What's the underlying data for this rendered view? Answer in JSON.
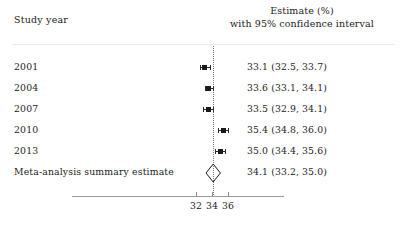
{
  "header": {
    "study_column_label": "Study year",
    "estimate_column_line1": "Estimate (%)",
    "estimate_column_line2": "with 95% confidence interval"
  },
  "chart_data": {
    "type": "forest",
    "title": "",
    "xlabel": "",
    "ylabel": "",
    "xlim": [
      30.5,
      37.5
    ],
    "xticks": [
      32,
      34,
      36
    ],
    "xtick_labels": [
      "32",
      "34",
      "36"
    ],
    "grid": false,
    "reference_line": 34.1,
    "reference_line_style": "dotted",
    "categories": [
      "2001",
      "2004",
      "2007",
      "2010",
      "2013",
      "Meta-analysis summary estimate"
    ],
    "rows": [
      {
        "label": "2001",
        "estimate": 33.1,
        "ci_low": 32.5,
        "ci_high": 33.7,
        "value_text": "33.1 (32.5, 33.7)",
        "marker": "square"
      },
      {
        "label": "2004",
        "estimate": 33.6,
        "ci_low": 33.1,
        "ci_high": 34.1,
        "value_text": "33.6 (33.1, 34.1)",
        "marker": "square"
      },
      {
        "label": "2007",
        "estimate": 33.5,
        "ci_low": 32.9,
        "ci_high": 34.1,
        "value_text": "33.5 (32.9, 34.1)",
        "marker": "square"
      },
      {
        "label": "2010",
        "estimate": 35.4,
        "ci_low": 34.8,
        "ci_high": 36.0,
        "value_text": "35.4 (34.8, 36.0)",
        "marker": "square"
      },
      {
        "label": "2013",
        "estimate": 35.0,
        "ci_low": 34.4,
        "ci_high": 35.6,
        "value_text": "35.0 (34.4, 35.6)",
        "marker": "square"
      },
      {
        "label": "Meta-analysis summary estimate",
        "estimate": 34.1,
        "ci_low": 33.2,
        "ci_high": 35.0,
        "value_text": "34.1 (33.2, 35.0)",
        "marker": "diamond"
      }
    ],
    "colors": {
      "marker": "#1a1a1a",
      "ci_line": "#2b2b2b",
      "reference_line": "#7a7a80",
      "axis": "#9a9a9e",
      "rule": "#e9e9ec",
      "text": "#1d1d1d",
      "background": "#ffffff"
    }
  }
}
